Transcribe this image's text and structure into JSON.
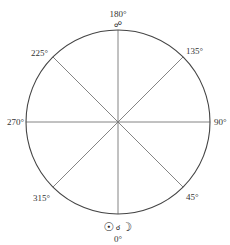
{
  "diagram": {
    "type": "aspect-wheel",
    "center": {
      "x": 118,
      "y": 122
    },
    "radius": 92,
    "stroke_color": "#444444",
    "spoke_color": "#777777",
    "labels": {
      "top": "180°",
      "bottom": "0°",
      "left": "270°",
      "right": "90°",
      "upper_left": "225°",
      "upper_right": "135°",
      "lower_left": "315°",
      "lower_right": "45°"
    },
    "symbols": {
      "top_aspect": "☍",
      "bottom_sun": "☉",
      "bottom_aspect": "☌",
      "bottom_moon": "☽"
    }
  }
}
